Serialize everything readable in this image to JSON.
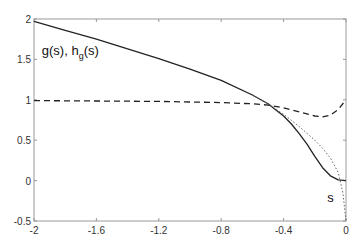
{
  "chart_data": {
    "type": "line",
    "title": "",
    "xlabel": "",
    "ylabel": "",
    "xlim": [
      -2,
      0
    ],
    "ylim": [
      -0.5,
      2
    ],
    "grid": false,
    "legend": null,
    "x_ticks": [
      -2,
      -1.6,
      -1.2,
      -0.8,
      -0.4,
      0
    ],
    "x_tick_labels": [
      "-2",
      "-1.6",
      "-1.2",
      "-0.8",
      "-0.4",
      "0"
    ],
    "y_ticks": [
      -0.5,
      0,
      0.5,
      1,
      1.5,
      2
    ],
    "y_tick_labels": [
      "-0.5",
      "0",
      "0.5",
      "1",
      "1.5",
      "2"
    ],
    "annotations": [
      {
        "text": "g(s), h",
        "sub": "g",
        "tail": "(s)",
        "x": -1.95,
        "y": 1.55
      },
      {
        "text": "s",
        "x": -0.12,
        "y": -0.27
      }
    ],
    "series": [
      {
        "name": "g(s)",
        "style": "solid",
        "color": "#222222",
        "x": [
          -2,
          -1.8,
          -1.6,
          -1.4,
          -1.2,
          -1.0,
          -0.8,
          -0.6,
          -0.5,
          -0.4,
          -0.35,
          -0.3,
          -0.25,
          -0.2,
          -0.15,
          -0.1,
          -0.05,
          0
        ],
        "y": [
          1.97,
          1.86,
          1.75,
          1.63,
          1.51,
          1.38,
          1.24,
          1.06,
          0.95,
          0.8,
          0.7,
          0.58,
          0.45,
          0.3,
          0.16,
          0.06,
          0.01,
          0.0
        ]
      },
      {
        "name": "h_g(s)",
        "style": "dashed",
        "color": "#222222",
        "x": [
          -2,
          -1.6,
          -1.2,
          -0.8,
          -0.6,
          -0.5,
          -0.4,
          -0.3,
          -0.2,
          -0.15,
          -0.1,
          -0.05,
          0
        ],
        "y": [
          0.99,
          0.985,
          0.98,
          0.965,
          0.95,
          0.935,
          0.9,
          0.85,
          0.8,
          0.79,
          0.81,
          0.88,
          1.0
        ]
      },
      {
        "name": "approximation",
        "style": "dotted",
        "color": "#666666",
        "x": [
          -0.6,
          -0.5,
          -0.4,
          -0.3,
          -0.2,
          -0.15,
          -0.1,
          -0.05,
          -0.02,
          0
        ],
        "y": [
          1.06,
          0.95,
          0.82,
          0.67,
          0.5,
          0.4,
          0.28,
          0.1,
          -0.15,
          -0.5
        ]
      }
    ]
  }
}
